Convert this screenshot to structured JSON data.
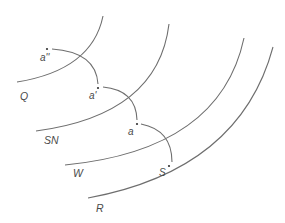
{
  "diagram": {
    "type": "concentric arc construction",
    "large_arcs": [
      {
        "id": "Q",
        "label": "Q"
      },
      {
        "id": "SN",
        "label": "SN"
      },
      {
        "id": "W",
        "label": "W"
      },
      {
        "id": "R",
        "label": "R"
      }
    ],
    "points": [
      {
        "id": "a2",
        "label": "a''"
      },
      {
        "id": "a1",
        "label": "a'"
      },
      {
        "id": "a0",
        "label": "a"
      },
      {
        "id": "s",
        "label": "S"
      }
    ],
    "colors": {
      "stroke": "#6e6e6e",
      "text": "#4a4a4a",
      "background": "#ffffff"
    }
  }
}
